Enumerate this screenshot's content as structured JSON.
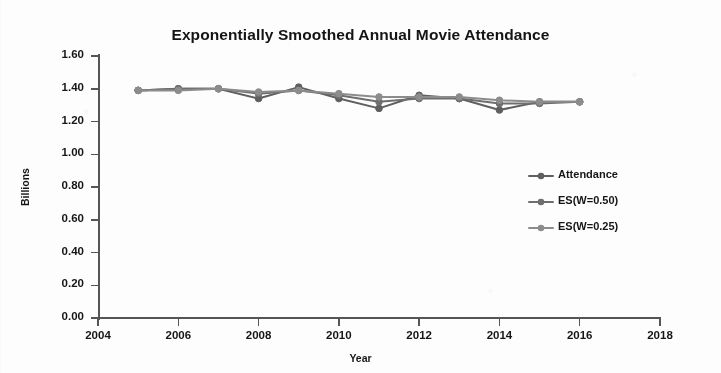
{
  "chart_data": {
    "type": "line",
    "title": "Exponentially Smoothed Annual Movie Attendance",
    "xlabel": "Year",
    "ylabel": "Billions",
    "x": [
      2005,
      2006,
      2007,
      2008,
      2009,
      2010,
      2011,
      2012,
      2013,
      2014,
      2015,
      2016
    ],
    "xlim": [
      2004,
      2018
    ],
    "ylim": [
      0.0,
      1.6
    ],
    "xticks": [
      2004,
      2006,
      2008,
      2010,
      2012,
      2014,
      2016,
      2018
    ],
    "yticks": [
      0.0,
      0.2,
      0.4,
      0.6,
      0.8,
      1.0,
      1.2,
      1.4,
      1.6
    ],
    "ytick_labels": [
      "0.00",
      "0.20",
      "0.40",
      "0.60",
      "0.80",
      "1.00",
      "1.20",
      "1.40",
      "1.60"
    ],
    "xtick_labels": [
      "2004",
      "2006",
      "2008",
      "2010",
      "2012",
      "2014",
      "2016",
      "2018"
    ],
    "grid": false,
    "legend_position": "right",
    "series": [
      {
        "name": "Attendance",
        "color": "#5f5f5f",
        "values": [
          1.39,
          1.4,
          1.4,
          1.34,
          1.41,
          1.34,
          1.28,
          1.36,
          1.34,
          1.27,
          1.32,
          1.32
        ]
      },
      {
        "name": "ES(W=0.50)",
        "color": "#6e6e6e",
        "values": [
          1.39,
          1.4,
          1.4,
          1.37,
          1.39,
          1.36,
          1.32,
          1.34,
          1.34,
          1.31,
          1.31,
          1.32
        ]
      },
      {
        "name": "ES(W=0.25)",
        "color": "#8c8c8c",
        "values": [
          1.39,
          1.39,
          1.4,
          1.38,
          1.39,
          1.37,
          1.35,
          1.35,
          1.35,
          1.33,
          1.32,
          1.32
        ]
      }
    ]
  },
  "legend": {
    "items": [
      {
        "label": "Attendance"
      },
      {
        "label": "ES(W=0.50)"
      },
      {
        "label": "ES(W=0.25)"
      }
    ]
  }
}
